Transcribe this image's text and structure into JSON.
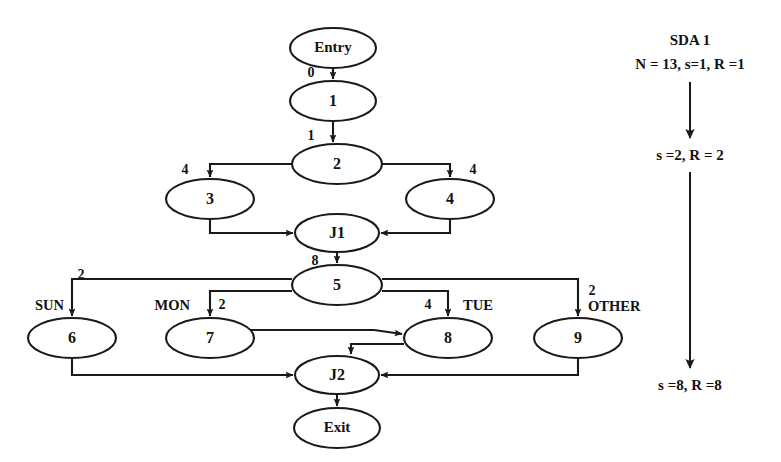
{
  "diagram": {
    "colors": {
      "stroke": "#1a1a1a",
      "text": "#121212",
      "background": "#ffffff"
    },
    "nodes": [
      {
        "id": "entry",
        "label": "Entry",
        "cx": 333,
        "cy": 48,
        "rx": 43,
        "ry": 20
      },
      {
        "id": "n1",
        "label": "1",
        "cx": 333,
        "cy": 101,
        "rx": 43,
        "ry": 20
      },
      {
        "id": "n2",
        "label": "2",
        "cx": 337,
        "cy": 164,
        "rx": 45,
        "ry": 20
      },
      {
        "id": "n3",
        "label": "3",
        "cx": 210,
        "cy": 199,
        "rx": 44,
        "ry": 20
      },
      {
        "id": "n4",
        "label": "4",
        "cx": 450,
        "cy": 199,
        "rx": 44,
        "ry": 20
      },
      {
        "id": "j1",
        "label": "J1",
        "cx": 337,
        "cy": 233,
        "rx": 42,
        "ry": 19
      },
      {
        "id": "n5",
        "label": "5",
        "cx": 337,
        "cy": 285,
        "rx": 45,
        "ry": 20
      },
      {
        "id": "n6",
        "label": "6",
        "cx": 72,
        "cy": 338,
        "rx": 44,
        "ry": 20
      },
      {
        "id": "n7",
        "label": "7",
        "cx": 210,
        "cy": 338,
        "rx": 44,
        "ry": 20
      },
      {
        "id": "n8",
        "label": "8",
        "cx": 448,
        "cy": 338,
        "rx": 44,
        "ry": 20
      },
      {
        "id": "n9",
        "label": "9",
        "cx": 578,
        "cy": 338,
        "rx": 44,
        "ry": 20
      },
      {
        "id": "j2",
        "label": "J2",
        "cx": 337,
        "cy": 375,
        "rx": 42,
        "ry": 19
      },
      {
        "id": "exit",
        "label": "Exit",
        "cx": 337,
        "cy": 428,
        "rx": 43,
        "ry": 20
      }
    ],
    "edges": [
      {
        "id": "entry-1",
        "from": "entry",
        "to": "n1",
        "label": "0",
        "label_x": 311,
        "label_y": 74
      },
      {
        "id": "1-2",
        "from": "n1",
        "to": "n2",
        "label": "1",
        "label_x": 311,
        "label_y": 137
      },
      {
        "id": "2-3",
        "from": "n2",
        "to": "n3",
        "label": "4",
        "label_x": 185,
        "label_y": 171
      },
      {
        "id": "2-4",
        "from": "n2",
        "to": "n4",
        "label": "4",
        "label_x": 473,
        "label_y": 171
      },
      {
        "id": "3-j1",
        "from": "n3",
        "to": "j1",
        "label": "",
        "label_x": 0,
        "label_y": 0
      },
      {
        "id": "4-j1",
        "from": "n4",
        "to": "j1",
        "label": "",
        "label_x": 0,
        "label_y": 0
      },
      {
        "id": "j1-5",
        "from": "j1",
        "to": "n5",
        "label": "8",
        "label_x": 315,
        "label_y": 262
      },
      {
        "id": "5-6",
        "from": "n5",
        "to": "n6",
        "label": "2",
        "label_x": 81,
        "label_y": 276
      },
      {
        "id": "5-7",
        "from": "n5",
        "to": "n7",
        "label": "2",
        "label_x": 222,
        "label_y": 306
      },
      {
        "id": "5-8",
        "from": "n5",
        "to": "n8",
        "label": "4",
        "label_x": 428,
        "label_y": 306
      },
      {
        "id": "5-9",
        "from": "n5",
        "to": "n9",
        "label": "2",
        "label_x": 592,
        "label_y": 292
      },
      {
        "id": "7-8",
        "from": "n7",
        "to": "n8",
        "label": "",
        "label_x": 0,
        "label_y": 0
      },
      {
        "id": "8-j2",
        "from": "n8",
        "to": "j2",
        "label": "",
        "label_x": 0,
        "label_y": 0
      },
      {
        "id": "6-j2",
        "from": "n6",
        "to": "j2",
        "label": "",
        "label_x": 0,
        "label_y": 0
      },
      {
        "id": "9-j2",
        "from": "n9",
        "to": "j2",
        "label": "",
        "label_x": 0,
        "label_y": 0
      },
      {
        "id": "j2-exit",
        "from": "j2",
        "to": "exit",
        "label": "",
        "label_x": 0,
        "label_y": 0
      }
    ],
    "branch_labels": [
      {
        "id": "sun",
        "text": "SUN",
        "x": 64,
        "y": 307,
        "anchor": "end"
      },
      {
        "id": "mon",
        "text": "MON",
        "x": 190,
        "y": 307,
        "anchor": "end"
      },
      {
        "id": "tue",
        "text": "TUE",
        "x": 463,
        "y": 307,
        "anchor": "start"
      },
      {
        "id": "other",
        "text": "OTHER",
        "x": 588,
        "y": 308,
        "anchor": "start"
      }
    ],
    "sda": {
      "title": "SDA 1",
      "title_x": 690,
      "title_y": 42,
      "line1": "N = 13, s=1, R =1",
      "line1_x": 690,
      "line1_y": 66,
      "line2": "s =2, R = 2",
      "line2_x": 690,
      "line2_y": 157,
      "line3": "s =8, R =8",
      "line3_x": 690,
      "line3_y": 387,
      "arrow1_x": 690,
      "arrow1_y1": 82,
      "arrow1_y2": 138,
      "arrow2_x": 690,
      "arrow2_y1": 172,
      "arrow2_y2": 368
    }
  }
}
